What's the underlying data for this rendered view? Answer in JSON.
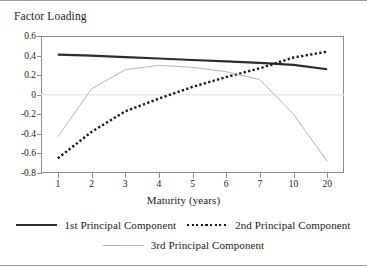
{
  "chart_data": {
    "type": "line",
    "title": "Factor Loading",
    "xlabel": "Maturity (years)",
    "ylabel": "",
    "categories": [
      "1",
      "2",
      "3",
      "4",
      "5",
      "6",
      "7",
      "10",
      "20"
    ],
    "yticks": [
      "0.6",
      "0.4",
      "0.2",
      "0",
      "-0.2",
      "-0.4",
      "-0.6",
      "-0.8"
    ],
    "ytick_values": [
      0.6,
      0.4,
      0.2,
      0,
      -0.2,
      -0.4,
      -0.6,
      -0.8
    ],
    "ylim": [
      -0.8,
      0.6
    ],
    "grid": false,
    "zero_line": true,
    "legend_position": "bottom",
    "series": [
      {
        "name": "1st Principal Component",
        "style": "solid-thick",
        "color": "#2b2b2b",
        "values": [
          0.41,
          0.4,
          0.385,
          0.37,
          0.355,
          0.34,
          0.325,
          0.305,
          0.26
        ]
      },
      {
        "name": "2nd Principal Component",
        "style": "dotted",
        "color": "#1a1a1a",
        "values": [
          -0.65,
          -0.38,
          -0.17,
          -0.04,
          0.08,
          0.18,
          0.27,
          0.38,
          0.44
        ]
      },
      {
        "name": "3rd Principal Component",
        "style": "solid-thin",
        "color": "#b4b4b4",
        "values": [
          -0.43,
          0.06,
          0.255,
          0.3,
          0.28,
          0.235,
          0.155,
          -0.2,
          -0.68
        ]
      }
    ]
  },
  "legend": {
    "rows": [
      [
        {
          "label": "1st Principal Component",
          "swatch": "solid-thick"
        },
        {
          "label": "2nd Principal Component",
          "swatch": "dotted"
        }
      ],
      [
        {
          "label": "3rd Principal Component",
          "swatch": "solid-thin"
        }
      ]
    ]
  }
}
